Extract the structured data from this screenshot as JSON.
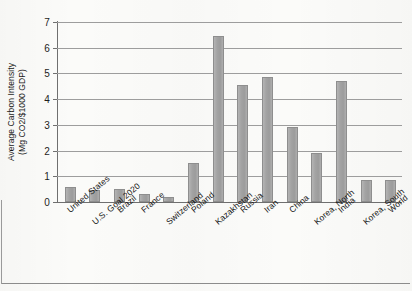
{
  "chart_data": {
    "type": "bar",
    "title": "",
    "xlabel": "",
    "ylabel": "Average Carbon Intensity (Mg CO2/$1000 GDP)",
    "ylabel_line1": "Average Carbon Intensity",
    "ylabel_line2": "(Mg CO2/$1000 GDP)",
    "ylim": [
      0,
      7
    ],
    "ytick_labels": [
      "7",
      "6",
      "5",
      "4",
      "3",
      "2",
      "1",
      "0"
    ],
    "ytick_values": [
      7,
      6,
      5,
      4,
      3,
      2,
      1,
      0
    ],
    "grid": true,
    "grid_orientation": "horizontal",
    "legend": "none",
    "bar_color": "#a5a5a5",
    "bar_edge_color": "#8e8e8e",
    "categories": [
      "United States",
      "U.S. Goal 2020",
      "Brazil",
      "France",
      "Switzerland",
      "Poland",
      "Kazakhstan",
      "Russia",
      "Iran",
      "China",
      "Korea, North",
      "India",
      "Korea, South",
      "World"
    ],
    "values": [
      0.58,
      0.47,
      0.52,
      0.3,
      0.18,
      1.5,
      6.45,
      4.55,
      4.88,
      2.92,
      1.9,
      4.7,
      0.85,
      0.85
    ]
  }
}
